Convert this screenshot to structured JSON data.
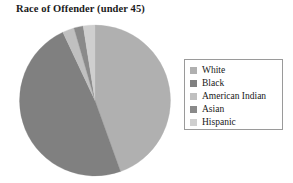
{
  "chart_data": {
    "type": "pie",
    "title": "Race of Offender (under 45)",
    "categories": [
      "White",
      "Black",
      "American Indian",
      "Asian",
      "Hispanic"
    ],
    "values": [
      44.5,
      48.5,
      2.5,
      2.0,
      2.5
    ],
    "unit": "percent",
    "start_angle_deg": 0,
    "direction": "clockwise",
    "colors": [
      "#b0b0b0",
      "#808080",
      "#c0c0c0",
      "#8a8a8a",
      "#cfcfcf"
    ],
    "legend": {
      "position": "right",
      "bordered": true,
      "entries": [
        {
          "label": "White",
          "color": "#b0b0b0"
        },
        {
          "label": "Black",
          "color": "#808080"
        },
        {
          "label": "American Indian",
          "color": "#c0c0c0"
        },
        {
          "label": "Asian",
          "color": "#8a8a8a"
        },
        {
          "label": "Hispanic",
          "color": "#cfcfcf"
        }
      ]
    },
    "xlabel": "",
    "ylabel": "",
    "grid": false,
    "data_labels": false
  }
}
